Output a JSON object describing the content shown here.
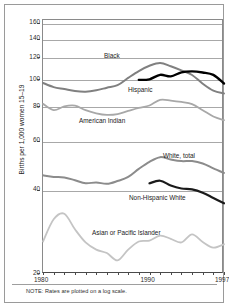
{
  "chart_data": {
    "type": "line",
    "title": "",
    "xlabel": "",
    "ylabel": "Births per 1,000 women 15–19",
    "note": "NOTE: Rates are plotted on a log scale.",
    "yscale": "log",
    "ylim": [
      20,
      165
    ],
    "yticks": [
      160,
      140,
      120,
      100,
      80,
      60,
      40,
      20
    ],
    "ytick_labels": [
      "160",
      "140",
      "120",
      "100",
      "80",
      "60",
      "40",
      "20"
    ],
    "xlim": [
      1980,
      1997
    ],
    "xticks": [
      1980,
      1981,
      1982,
      1983,
      1984,
      1985,
      1986,
      1987,
      1988,
      1989,
      1990,
      1991,
      1992,
      1993,
      1994,
      1995,
      1996,
      1997
    ],
    "xtick_labels": [
      "1980",
      "1990",
      "1997"
    ],
    "xtick_labeled_values": [
      1980,
      1990,
      1997
    ],
    "grid": "horizontal",
    "legend_position": "inline-annotations",
    "series": [
      {
        "name": "Black",
        "label": "Black",
        "color": "#808080",
        "width": 2.0,
        "x": [
          1980,
          1981,
          1982,
          1983,
          1984,
          1985,
          1986,
          1987,
          1988,
          1989,
          1990,
          1991,
          1992,
          1993,
          1994,
          1995,
          1996,
          1997
        ],
        "values": [
          97.8,
          94.5,
          93.0,
          91.5,
          91.0,
          92.0,
          94.0,
          96.0,
          102.0,
          108.0,
          112.8,
          115.5,
          112.4,
          108.6,
          104.5,
          97.2,
          91.7,
          89.6
        ]
      },
      {
        "name": "Hispanic",
        "label": "Hispanic",
        "color": "#000000",
        "width": 2.4,
        "x": [
          1989,
          1990,
          1991,
          1992,
          1993,
          1994,
          1995,
          1996,
          1997
        ],
        "values": [
          100.3,
          100.8,
          104.6,
          103.3,
          106.8,
          107.7,
          106.7,
          104.6,
          97.4
        ]
      },
      {
        "name": "American Indian",
        "label": "American Indian",
        "color": "#a8a8a8",
        "width": 1.8,
        "x": [
          1980,
          1981,
          1982,
          1983,
          1984,
          1985,
          1986,
          1987,
          1988,
          1989,
          1990,
          1991,
          1992,
          1993,
          1994,
          1995,
          1996,
          1997
        ],
        "values": [
          82.2,
          78.0,
          80.5,
          81.0,
          78.0,
          76.0,
          75.0,
          75.5,
          77.5,
          79.5,
          81.1,
          85.0,
          84.5,
          83.5,
          82.0,
          78.0,
          74.0,
          71.8
        ]
      },
      {
        "name": "White, total",
        "label": "White, total",
        "color": "#8c8c8c",
        "width": 2.0,
        "x": [
          1980,
          1981,
          1982,
          1983,
          1984,
          1985,
          1986,
          1987,
          1988,
          1989,
          1990,
          1991,
          1992,
          1993,
          1994,
          1995,
          1996,
          1997
        ],
        "values": [
          45.4,
          44.8,
          44.6,
          43.6,
          42.5,
          42.8,
          42.3,
          43.3,
          44.8,
          47.9,
          50.8,
          52.8,
          51.8,
          51.1,
          51.1,
          50.1,
          48.1,
          46.3
        ]
      },
      {
        "name": "Non-Hispanic White",
        "label": "Non-Hispanic White",
        "color": "#1a1a1a",
        "width": 2.2,
        "x": [
          1990,
          1991,
          1992,
          1993,
          1994,
          1995,
          1996,
          1997
        ],
        "values": [
          42.5,
          43.4,
          41.7,
          40.7,
          40.4,
          39.3,
          37.6,
          36.0
        ]
      },
      {
        "name": "Asian or Pacific Islander",
        "label": "Asian or Pacific Islander",
        "color": "#c4c4c4",
        "width": 1.8,
        "x": [
          1980,
          1981,
          1982,
          1983,
          1984,
          1985,
          1986,
          1987,
          1988,
          1989,
          1990,
          1991,
          1992,
          1993,
          1994,
          1995,
          1996,
          1997
        ],
        "values": [
          26.2,
          31.5,
          33.0,
          29.0,
          26.0,
          24.5,
          23.8,
          22.4,
          24.5,
          26.2,
          26.4,
          27.5,
          26.8,
          26.0,
          27.8,
          26.1,
          24.9,
          25.6
        ]
      }
    ],
    "annotations": [
      {
        "text": "Black",
        "x_px": 104,
        "y_px": 52
      },
      {
        "text": "Hispanic",
        "x_px": 128,
        "y_px": 86
      },
      {
        "text": "American Indian",
        "x_px": 79,
        "y_px": 117
      },
      {
        "text": "White, total",
        "x_px": 163,
        "y_px": 152
      },
      {
        "text": "Non-Hispanic White",
        "x_px": 129,
        "y_px": 194
      },
      {
        "text": "Asian or Pacific Islander",
        "x_px": 92,
        "y_px": 229
      }
    ]
  }
}
